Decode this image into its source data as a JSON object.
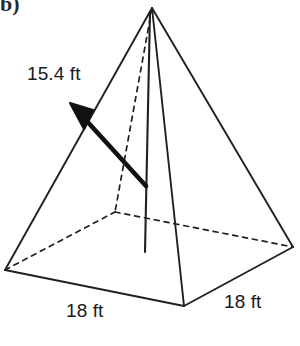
{
  "figure": {
    "kind": "square-pyramid",
    "corner_mark": "b)",
    "background_color": "#ffffff",
    "stroke_color": "#231f20",
    "arrow_color": "#111111",
    "labels": {
      "slant_height": "15.4 ft",
      "base_front": "18 ft",
      "base_right": "18 ft"
    },
    "measurements": [
      {
        "name": "slant-height",
        "value": 15.4,
        "unit": "ft",
        "text": "15.4 ft"
      },
      {
        "name": "base-edge-front",
        "value": 18,
        "unit": "ft",
        "text": "18 ft"
      },
      {
        "name": "base-edge-right",
        "value": 18,
        "unit": "ft",
        "text": "18 ft"
      }
    ],
    "vertices": {
      "apex": [
        152,
        8
      ],
      "base_left": [
        5,
        270
      ],
      "base_front": [
        184,
        306
      ],
      "base_right": [
        293,
        247
      ],
      "base_back_hidden": [
        115,
        212
      ],
      "height_foot": [
        145,
        252
      ]
    },
    "arrow": {
      "tail": [
        146,
        186
      ],
      "tip": [
        70,
        103
      ]
    }
  }
}
